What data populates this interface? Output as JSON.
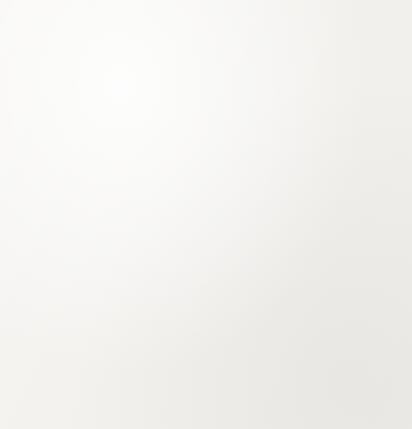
{
  "figure": {
    "name": "coordinate-plane-with-four-plotted-points",
    "background_color": "#f5f4f2",
    "width": 412,
    "height": 429
  },
  "chart_data": {
    "type": "scatter",
    "title": "",
    "subtitle": "",
    "xlabel": "",
    "ylabel": "",
    "xlim": [
      -10,
      10
    ],
    "ylim": [
      -10,
      10
    ],
    "xticks": [
      -10,
      -9,
      -8,
      -7,
      -6,
      -5,
      -4,
      -3,
      -2,
      -1,
      0,
      1,
      2,
      3,
      4,
      5,
      6,
      7,
      8,
      9,
      10
    ],
    "yticks": [
      -10,
      -9,
      -8,
      -7,
      -6,
      -5,
      -4,
      -3,
      -2,
      -1,
      0,
      1,
      2,
      3,
      4,
      5,
      6,
      7,
      8,
      9,
      10
    ],
    "tick_labels_visible": false,
    "grid": true,
    "grid_columns": 20,
    "grid_rows": 20,
    "grid_color": "#8f8f8f",
    "axis_color": "#0d0d0d",
    "axes_arrows": [
      "left",
      "right",
      "up",
      "down"
    ],
    "legend": null,
    "point_color": "#0d0d0d",
    "point_radius_px": 6,
    "points": [
      {
        "label": "upper-left-point",
        "x": -3,
        "y": 2
      },
      {
        "label": "upper-right-point",
        "x": 3,
        "y": 2
      },
      {
        "label": "lower-left-point",
        "x": -3,
        "y": -2
      },
      {
        "label": "lower-right-point",
        "x": 3,
        "y": -2
      }
    ],
    "annotations": []
  },
  "geometry": {
    "grid_left_px": 24,
    "grid_top_px": 31,
    "cell_size_px": 18,
    "origin_x_px": 204,
    "origin_y_px": 214,
    "x_axis_start_px": 12,
    "x_axis_end_px": 400,
    "y_axis_start_px": 10,
    "y_axis_end_px": 417
  }
}
